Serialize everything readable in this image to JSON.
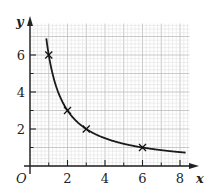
{
  "chart_data": {
    "type": "line",
    "title": "",
    "xlabel": "x",
    "ylabel": "y",
    "origin_label": "O",
    "function": "y = 6/x",
    "xlim": [
      0,
      8.5
    ],
    "ylim": [
      0,
      7.7
    ],
    "x_ticks": [
      2,
      4,
      6,
      8
    ],
    "y_ticks": [
      2,
      4,
      6
    ],
    "x_minor_ticks": [
      1,
      3,
      5,
      7
    ],
    "y_minor_ticks": [
      1,
      3,
      5
    ],
    "grid": true,
    "curve_x_range": [
      0.87,
      8.3
    ],
    "marked_points": [
      {
        "x": 1,
        "y": 6
      },
      {
        "x": 2,
        "y": 3
      },
      {
        "x": 3,
        "y": 2
      },
      {
        "x": 6,
        "y": 1
      }
    ],
    "colors": {
      "curve": "#1a1a1a",
      "grid_minor": "#dcdcdc",
      "grid_major": "#bdbdbd",
      "axis": "#222222"
    }
  }
}
